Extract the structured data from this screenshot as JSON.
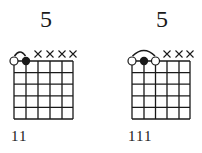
{
  "chords": [
    {
      "title": "5",
      "fingering": "11",
      "strings": 6,
      "frets": 5,
      "muted_strings": [
        3,
        4,
        5,
        6
      ],
      "barre": {
        "from_string": 1,
        "to_string": 2
      },
      "dots": [
        {
          "string": 1,
          "fret": 0,
          "type": "open"
        },
        {
          "string": 2,
          "fret": 0,
          "type": "filled"
        }
      ]
    },
    {
      "title": "5",
      "fingering": "111",
      "strings": 6,
      "frets": 5,
      "muted_strings": [
        4,
        5,
        6
      ],
      "barre": {
        "from_string": 1,
        "to_string": 3
      },
      "dots": [
        {
          "string": 1,
          "fret": 0,
          "type": "open"
        },
        {
          "string": 2,
          "fret": 0,
          "type": "filled"
        },
        {
          "string": 3,
          "fret": 0,
          "type": "open"
        }
      ]
    }
  ],
  "colors": {
    "ink": "#1a1a1a",
    "background": "#ffffff"
  }
}
